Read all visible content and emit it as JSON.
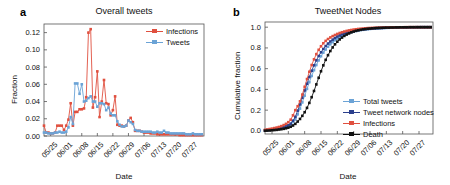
{
  "figure": {
    "width": 450,
    "height": 185,
    "background": "#ffffff"
  },
  "colors": {
    "infections": "#e0503f",
    "tweets": "#6ba3d6",
    "total_tweets": "#6ba3d6",
    "tweet_network_nodes": "#2b3f8c",
    "death": "#111111",
    "axis": "#555555",
    "text": "#111111"
  },
  "panels": [
    {
      "letter": "a",
      "title": "Overall tweets",
      "xlabel": "Date",
      "ylabel": "Fraction",
      "legend": [
        {
          "label": "Infections",
          "color": "#e0503f",
          "marker": "square"
        },
        {
          "label": "Tweets",
          "color": "#6ba3d6",
          "marker": "square"
        }
      ]
    },
    {
      "letter": "b",
      "title": "TweetNet Nodes",
      "xlabel": "Date",
      "ylabel": "Cumulative fraction",
      "legend": [
        {
          "label": "Total tweets",
          "color": "#6ba3d6",
          "marker": "square"
        },
        {
          "label": "Tweet network nodes",
          "color": "#2b3f8c",
          "marker": "plus"
        },
        {
          "label": "Infections",
          "color": "#e0503f",
          "marker": "square"
        },
        {
          "label": "Death",
          "color": "#111111",
          "marker": "star"
        }
      ]
    }
  ],
  "chart_data": [
    {
      "type": "line",
      "panel": "a",
      "title": "Overall tweets",
      "xlabel": "Date",
      "ylabel": "Fraction",
      "ylim": [
        0.0,
        0.13
      ],
      "yticks": [
        0.0,
        0.02,
        0.04,
        0.06,
        0.08,
        0.1,
        0.12
      ],
      "ytick_labels": [
        "0.00",
        "0.02",
        "0.04",
        "0.06",
        "0.08",
        "0.10",
        "0.12"
      ],
      "xticks": [
        3,
        10,
        17,
        24,
        31,
        38,
        45,
        52,
        59,
        66
      ],
      "xtick_labels": [
        "05/25",
        "06/01",
        "06/08",
        "06/15",
        "06/22",
        "06/29",
        "07/06",
        "07/13",
        "07/20",
        "07/27"
      ],
      "xlim": [
        0,
        72
      ],
      "grid": false,
      "legend_position": "top-right",
      "series": [
        {
          "name": "Infections",
          "color": "#e0503f",
          "x": [
            0,
            1,
            2,
            3,
            4,
            5,
            6,
            7,
            8,
            9,
            10,
            11,
            12,
            13,
            14,
            15,
            16,
            17,
            18,
            19,
            20,
            21,
            22,
            23,
            24,
            25,
            26,
            27,
            28,
            29,
            30,
            31,
            32,
            33,
            34,
            35,
            36,
            37,
            38,
            39,
            40,
            41,
            42,
            43,
            44,
            45,
            46,
            47,
            48,
            49,
            50,
            51,
            52,
            53,
            54,
            55,
            56,
            57,
            58,
            59,
            60,
            61,
            62,
            63,
            64,
            65,
            66,
            67,
            68,
            69,
            70,
            71
          ],
          "values": [
            0.012,
            0.004,
            0.004,
            0.003,
            0.003,
            0.004,
            0.012,
            0.012,
            0.012,
            0.007,
            0.012,
            0.019,
            0.038,
            0.012,
            0.028,
            0.028,
            0.031,
            0.031,
            0.032,
            0.045,
            0.12,
            0.124,
            0.033,
            0.045,
            0.075,
            0.022,
            0.04,
            0.065,
            0.038,
            0.037,
            0.024,
            0.03,
            0.046,
            0.013,
            0.012,
            0.012,
            0.011,
            0.012,
            0.018,
            0.021,
            0.016,
            0.006,
            0.006,
            0.006,
            0.005,
            0.004,
            0.004,
            0.004,
            0.003,
            0.003,
            0.003,
            0.002,
            0.002,
            0.002,
            0.002,
            0.002,
            0.002,
            0.002,
            0.002,
            0.002,
            0.002,
            0.001,
            0.001,
            0.001,
            0.001,
            0.001,
            0.001,
            0.001,
            0.001,
            0.001,
            0.001,
            0.001
          ]
        },
        {
          "name": "Tweets",
          "color": "#6ba3d6",
          "x": [
            0,
            1,
            2,
            3,
            4,
            5,
            6,
            7,
            8,
            9,
            10,
            11,
            12,
            13,
            14,
            15,
            16,
            17,
            18,
            19,
            20,
            21,
            22,
            23,
            24,
            25,
            26,
            27,
            28,
            29,
            30,
            31,
            32,
            33,
            34,
            35,
            36,
            37,
            38,
            39,
            40,
            41,
            42,
            43,
            44,
            45,
            46,
            47,
            48,
            49,
            50,
            51,
            52,
            53,
            54,
            55,
            56,
            57,
            58,
            59,
            60,
            61,
            62,
            63,
            64,
            65,
            66,
            67,
            68,
            69,
            70,
            71
          ],
          "values": [
            0.004,
            0.004,
            0.003,
            0.003,
            0.003,
            0.004,
            0.004,
            0.005,
            0.004,
            0.004,
            0.005,
            0.01,
            0.022,
            0.014,
            0.061,
            0.061,
            0.049,
            0.06,
            0.04,
            0.041,
            0.044,
            0.046,
            0.04,
            0.04,
            0.034,
            0.038,
            0.038,
            0.037,
            0.03,
            0.033,
            0.026,
            0.024,
            0.024,
            0.017,
            0.013,
            0.011,
            0.011,
            0.012,
            0.018,
            0.016,
            0.014,
            0.007,
            0.006,
            0.006,
            0.005,
            0.005,
            0.005,
            0.005,
            0.005,
            0.004,
            0.004,
            0.005,
            0.004,
            0.004,
            0.006,
            0.004,
            0.004,
            0.003,
            0.003,
            0.003,
            0.003,
            0.003,
            0.003,
            0.003,
            0.002,
            0.002,
            0.002,
            0.003,
            0.002,
            0.002,
            0.002,
            0.002
          ]
        }
      ]
    },
    {
      "type": "line",
      "panel": "b",
      "title": "TweetNet Nodes",
      "xlabel": "Date",
      "ylabel": "Cumulative fraction",
      "ylim": [
        -0.03,
        1.05
      ],
      "yticks": [
        0.0,
        0.2,
        0.4,
        0.6,
        0.8,
        1.0
      ],
      "ytick_labels": [
        "0.0",
        "0.2",
        "0.4",
        "0.6",
        "0.8",
        "1.0"
      ],
      "xticks": [
        3,
        10,
        17,
        24,
        31,
        38,
        45,
        52,
        59,
        66
      ],
      "xtick_labels": [
        "05/25",
        "06/01",
        "06/08",
        "06/15",
        "06/22",
        "06/29",
        "07/06",
        "07/13",
        "07/20",
        "07/27"
      ],
      "xlim": [
        0,
        72
      ],
      "grid": false,
      "legend_position": "center-right",
      "series": [
        {
          "name": "Total tweets",
          "color": "#6ba3d6",
          "x": [
            0,
            1,
            2,
            3,
            4,
            5,
            6,
            7,
            8,
            9,
            10,
            11,
            12,
            13,
            14,
            15,
            16,
            17,
            18,
            19,
            20,
            21,
            22,
            23,
            24,
            25,
            26,
            27,
            28,
            29,
            30,
            31,
            32,
            33,
            34,
            35,
            36,
            37,
            38,
            39,
            40,
            41,
            42,
            43,
            44,
            45,
            46,
            47,
            48,
            49,
            50,
            51,
            52,
            53,
            54,
            55,
            56,
            57,
            58,
            59,
            60,
            61,
            62,
            63,
            64,
            65,
            66,
            67,
            68,
            69,
            70,
            71
          ],
          "values": [
            0.005,
            0.008,
            0.01,
            0.013,
            0.016,
            0.02,
            0.024,
            0.03,
            0.036,
            0.042,
            0.05,
            0.062,
            0.085,
            0.11,
            0.16,
            0.215,
            0.275,
            0.34,
            0.405,
            0.47,
            0.53,
            0.585,
            0.635,
            0.68,
            0.72,
            0.755,
            0.785,
            0.812,
            0.835,
            0.856,
            0.874,
            0.89,
            0.904,
            0.916,
            0.927,
            0.936,
            0.944,
            0.951,
            0.957,
            0.963,
            0.968,
            0.972,
            0.975,
            0.978,
            0.981,
            0.983,
            0.985,
            0.987,
            0.989,
            0.99,
            0.991,
            0.992,
            0.993,
            0.994,
            0.995,
            0.995,
            0.996,
            0.996,
            0.997,
            0.997,
            0.998,
            0.998,
            0.998,
            0.999,
            0.999,
            0.999,
            0.999,
            1.0,
            1.0,
            1.0,
            1.0,
            1.0
          ]
        },
        {
          "name": "Tweet network nodes",
          "color": "#2b3f8c",
          "x": [
            0,
            1,
            2,
            3,
            4,
            5,
            6,
            7,
            8,
            9,
            10,
            11,
            12,
            13,
            14,
            15,
            16,
            17,
            18,
            19,
            20,
            21,
            22,
            23,
            24,
            25,
            26,
            27,
            28,
            29,
            30,
            31,
            32,
            33,
            34,
            35,
            36,
            37,
            38,
            39,
            40,
            41,
            42,
            43,
            44,
            45,
            46,
            47,
            48,
            49,
            50,
            51,
            52,
            53,
            54,
            55,
            56,
            57,
            58,
            59,
            60,
            61,
            62,
            63,
            64,
            65,
            66,
            67,
            68,
            69,
            70,
            71
          ],
          "values": [
            0.004,
            0.007,
            0.009,
            0.012,
            0.015,
            0.019,
            0.023,
            0.029,
            0.035,
            0.043,
            0.054,
            0.07,
            0.098,
            0.135,
            0.195,
            0.255,
            0.32,
            0.39,
            0.455,
            0.52,
            0.58,
            0.632,
            0.68,
            0.722,
            0.758,
            0.79,
            0.818,
            0.842,
            0.862,
            0.88,
            0.896,
            0.91,
            0.921,
            0.931,
            0.94,
            0.948,
            0.954,
            0.96,
            0.965,
            0.969,
            0.973,
            0.977,
            0.98,
            0.982,
            0.984,
            0.986,
            0.988,
            0.989,
            0.991,
            0.992,
            0.993,
            0.994,
            0.995,
            0.995,
            0.996,
            0.996,
            0.997,
            0.997,
            0.998,
            0.998,
            0.998,
            0.999,
            0.999,
            0.999,
            0.999,
            1.0,
            1.0,
            1.0,
            1.0,
            1.0,
            1.0,
            1.0
          ]
        },
        {
          "name": "Infections",
          "color": "#e0503f",
          "x": [
            0,
            1,
            2,
            3,
            4,
            5,
            6,
            7,
            8,
            9,
            10,
            11,
            12,
            13,
            14,
            15,
            16,
            17,
            18,
            19,
            20,
            21,
            22,
            23,
            24,
            25,
            26,
            27,
            28,
            29,
            30,
            31,
            32,
            33,
            34,
            35,
            36,
            37,
            38,
            39,
            40,
            41,
            42,
            43,
            44,
            45,
            46,
            47,
            48,
            49,
            50,
            51,
            52,
            53,
            54,
            55,
            56,
            57,
            58,
            59,
            60,
            61,
            62,
            63,
            64,
            65,
            66,
            67,
            68,
            69,
            70,
            71
          ],
          "values": [
            0.01,
            0.014,
            0.018,
            0.022,
            0.027,
            0.032,
            0.038,
            0.046,
            0.056,
            0.068,
            0.084,
            0.108,
            0.15,
            0.2,
            0.238,
            0.285,
            0.35,
            0.425,
            0.5,
            0.57,
            0.635,
            0.69,
            0.74,
            0.782,
            0.816,
            0.845,
            0.868,
            0.886,
            0.901,
            0.914,
            0.925,
            0.935,
            0.944,
            0.951,
            0.958,
            0.964,
            0.969,
            0.973,
            0.977,
            0.98,
            0.983,
            0.985,
            0.987,
            0.989,
            0.991,
            0.992,
            0.993,
            0.994,
            0.995,
            0.996,
            0.996,
            0.997,
            0.997,
            0.998,
            0.998,
            0.998,
            0.999,
            0.999,
            0.999,
            0.999,
            1.0,
            1.0,
            1.0,
            1.0,
            1.0,
            1.0,
            1.0,
            1.0,
            1.0,
            1.0,
            1.0,
            1.0
          ]
        },
        {
          "name": "Death",
          "color": "#111111",
          "x": [
            0,
            1,
            2,
            3,
            4,
            5,
            6,
            7,
            8,
            9,
            10,
            11,
            12,
            13,
            14,
            15,
            16,
            17,
            18,
            19,
            20,
            21,
            22,
            23,
            24,
            25,
            26,
            27,
            28,
            29,
            30,
            31,
            32,
            33,
            34,
            35,
            36,
            37,
            38,
            39,
            40,
            41,
            42,
            43,
            44,
            45,
            46,
            47,
            48,
            49,
            50,
            51,
            52,
            53,
            54,
            55,
            56,
            57,
            58,
            59,
            60,
            61,
            62,
            63,
            64,
            65,
            66,
            67,
            68,
            69,
            70,
            71
          ],
          "values": [
            0.002,
            0.003,
            0.004,
            0.006,
            0.008,
            0.01,
            0.013,
            0.016,
            0.02,
            0.025,
            0.031,
            0.04,
            0.052,
            0.068,
            0.09,
            0.115,
            0.145,
            0.18,
            0.222,
            0.27,
            0.325,
            0.385,
            0.448,
            0.512,
            0.575,
            0.632,
            0.685,
            0.73,
            0.77,
            0.805,
            0.835,
            0.86,
            0.882,
            0.9,
            0.916,
            0.929,
            0.94,
            0.95,
            0.958,
            0.965,
            0.97,
            0.975,
            0.979,
            0.982,
            0.985,
            0.987,
            0.989,
            0.991,
            0.992,
            0.993,
            0.994,
            0.995,
            0.996,
            0.996,
            0.997,
            0.997,
            0.998,
            0.998,
            0.999,
            0.999,
            0.999,
            0.999,
            1.0,
            1.0,
            1.0,
            1.0,
            1.0,
            1.0,
            1.0,
            1.0,
            1.0,
            1.0
          ]
        }
      ]
    }
  ]
}
